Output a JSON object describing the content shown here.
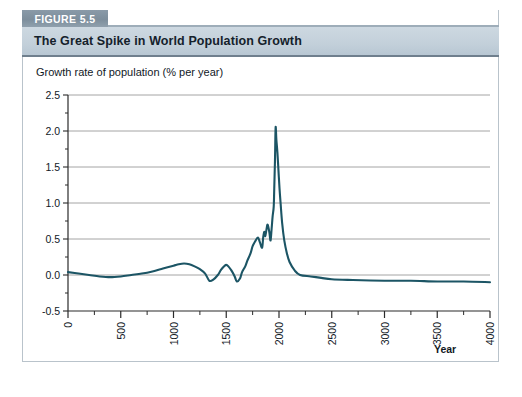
{
  "figure": {
    "badge_label": "FIGURE 5.5",
    "title": "The Great Spike in World Population Growth"
  },
  "colors": {
    "line": "#1c5565",
    "grid": "#9a9a9a",
    "axis": "#2a2a2a",
    "badge_bg": "#8a9aa8",
    "title_bg": "#c5d2dc"
  },
  "chart_data": {
    "type": "line",
    "title": "The Great Spike in World Population Growth",
    "xlabel": "Year",
    "ylabel": "Growth rate of population (% per year)",
    "xlim": [
      0,
      4000
    ],
    "ylim": [
      -0.5,
      2.5
    ],
    "grid": true,
    "legend": "none",
    "xticks": [
      0,
      500,
      1000,
      1500,
      2000,
      2500,
      3000,
      3500,
      4000
    ],
    "xtick_labels": [
      "0",
      "500",
      "1000",
      "1500",
      "2000",
      "2500",
      "3000",
      "3500",
      "4000"
    ],
    "xminor_step": 250,
    "yticks": [
      -0.5,
      0.0,
      0.5,
      1.0,
      1.5,
      2.0,
      2.5
    ],
    "ytick_labels": [
      "-0.5",
      "0.0",
      "0.5",
      "1.0",
      "1.5",
      "2.0",
      "2.5"
    ],
    "series": [
      {
        "name": "World population growth rate",
        "x": [
          0,
          100,
          200,
          300,
          400,
          500,
          600,
          700,
          800,
          900,
          1000,
          1050,
          1100,
          1150,
          1200,
          1250,
          1300,
          1340,
          1380,
          1420,
          1450,
          1480,
          1500,
          1520,
          1550,
          1580,
          1600,
          1630,
          1650,
          1680,
          1700,
          1730,
          1750,
          1775,
          1800,
          1820,
          1840,
          1850,
          1860,
          1870,
          1880,
          1890,
          1900,
          1910,
          1920,
          1930,
          1940,
          1950,
          1955,
          1962,
          1968,
          1975,
          1985,
          1995,
          2005,
          2015,
          2030,
          2050,
          2075,
          2100,
          2150,
          2200,
          2300,
          2400,
          2500,
          2700,
          3000,
          3250,
          3500,
          3750,
          4000
        ],
        "y": [
          0.04,
          0.02,
          0.0,
          -0.02,
          -0.03,
          -0.02,
          0.0,
          0.02,
          0.05,
          0.09,
          0.13,
          0.15,
          0.16,
          0.15,
          0.12,
          0.08,
          0.02,
          -0.08,
          -0.06,
          0.0,
          0.07,
          0.12,
          0.14,
          0.12,
          0.06,
          -0.02,
          -0.09,
          -0.05,
          0.04,
          0.12,
          0.2,
          0.3,
          0.4,
          0.47,
          0.52,
          0.45,
          0.38,
          0.52,
          0.6,
          0.54,
          0.62,
          0.7,
          0.66,
          0.58,
          0.48,
          0.64,
          0.82,
          0.95,
          1.2,
          1.6,
          2.05,
          1.88,
          1.7,
          1.45,
          1.2,
          1.0,
          0.72,
          0.48,
          0.3,
          0.18,
          0.06,
          0.0,
          -0.02,
          -0.04,
          -0.06,
          -0.07,
          -0.08,
          -0.08,
          -0.09,
          -0.09,
          -0.1
        ]
      }
    ],
    "peak": {
      "x": 1968,
      "y": 2.05,
      "note": "peak growth rate just above 2.0% per year"
    }
  }
}
